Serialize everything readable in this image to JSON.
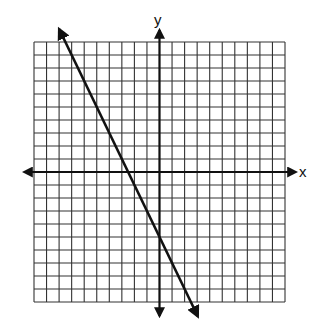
{
  "chart_data": {
    "type": "line",
    "title": "",
    "xlabel": "x",
    "ylabel": "y",
    "xlim": [
      -10,
      10
    ],
    "ylim": [
      -10,
      10
    ],
    "grid": true,
    "grid_step": 1,
    "axes_arrows": true,
    "tick_labels": [],
    "series": [
      {
        "name": "line",
        "equation": "y = -2x - 5",
        "slope": -2,
        "y_intercept": -5,
        "x_intercept": -2.5,
        "x": [
          -7.5,
          -2.5,
          0,
          2.5
        ],
        "y": [
          10,
          0,
          -5,
          -10
        ],
        "arrows_both_ends": true,
        "color": "#111111"
      }
    ]
  },
  "axes": {
    "x_label": "x",
    "y_label": "y"
  },
  "colors": {
    "grid": "#333333",
    "axis": "#111111",
    "line": "#111111",
    "background": "#ffffff"
  }
}
